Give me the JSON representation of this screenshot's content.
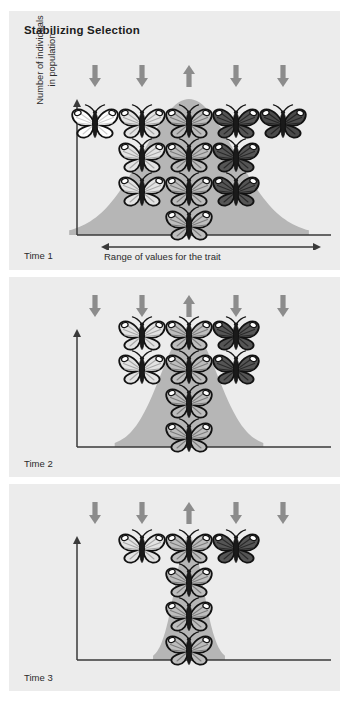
{
  "figure": {
    "title": "Stabilizing Selection",
    "background": "#ececec",
    "page_background": "#ffffff",
    "curve_color": "#b6b6b6",
    "arrow_color": "#8c8c8c",
    "axis_color": "#3a3a3a",
    "text_color": "#2b2b2b"
  },
  "axes": {
    "y_label": "Number of individuals\nin population",
    "x_label": "Range of values for the trait"
  },
  "arrows": {
    "directions": [
      "down",
      "down",
      "up",
      "down",
      "down"
    ],
    "count": 5
  },
  "panels": [
    {
      "id": "panel-1",
      "time_label": "Time 1",
      "show_axis_labels": true,
      "curve_width_factor": 1.0,
      "rows": [
        {
          "y": 0,
          "butterflies": [
            {
              "col": 2,
              "shade": "medium-light"
            }
          ]
        },
        {
          "y": 1,
          "butterflies": [
            {
              "col": 1,
              "shade": "light"
            },
            {
              "col": 2,
              "shade": "medium-light"
            },
            {
              "col": 3,
              "shade": "dark"
            }
          ]
        },
        {
          "y": 2,
          "butterflies": [
            {
              "col": 1,
              "shade": "light"
            },
            {
              "col": 2,
              "shade": "medium-light"
            },
            {
              "col": 3,
              "shade": "dark"
            }
          ]
        },
        {
          "y": 3,
          "butterflies": [
            {
              "col": 0,
              "shade": "white"
            },
            {
              "col": 1,
              "shade": "light"
            },
            {
              "col": 2,
              "shade": "medium-light"
            },
            {
              "col": 3,
              "shade": "dark"
            },
            {
              "col": 4,
              "shade": "darkest"
            }
          ]
        }
      ]
    },
    {
      "id": "panel-2",
      "time_label": "Time 2",
      "show_axis_labels": false,
      "curve_width_factor": 0.62,
      "rows": [
        {
          "y": 0,
          "butterflies": [
            {
              "col": 2,
              "shade": "medium-light"
            }
          ]
        },
        {
          "y": 1,
          "butterflies": [
            {
              "col": 2,
              "shade": "medium-light"
            }
          ]
        },
        {
          "y": 2,
          "butterflies": [
            {
              "col": 1,
              "shade": "light"
            },
            {
              "col": 2,
              "shade": "medium-light"
            },
            {
              "col": 3,
              "shade": "dark"
            }
          ]
        },
        {
          "y": 3,
          "butterflies": [
            {
              "col": 1,
              "shade": "light"
            },
            {
              "col": 2,
              "shade": "medium-light"
            },
            {
              "col": 3,
              "shade": "dark"
            }
          ]
        }
      ]
    },
    {
      "id": "panel-3",
      "time_label": "Time 3",
      "show_axis_labels": false,
      "curve_width_factor": 0.3,
      "rows": [
        {
          "y": 0,
          "butterflies": [
            {
              "col": 2,
              "shade": "medium-light"
            }
          ]
        },
        {
          "y": 1,
          "butterflies": [
            {
              "col": 2,
              "shade": "medium-light"
            }
          ]
        },
        {
          "y": 2,
          "butterflies": [
            {
              "col": 2,
              "shade": "medium-light"
            }
          ]
        },
        {
          "y": 3,
          "butterflies": [
            {
              "col": 1,
              "shade": "light"
            },
            {
              "col": 2,
              "shade": "medium-light"
            },
            {
              "col": 3,
              "shade": "dark"
            }
          ]
        }
      ]
    }
  ],
  "chart_data": {
    "type": "area",
    "title": "Stabilizing Selection",
    "xlabel": "Range of values for the trait",
    "ylabel": "Number of individuals in population",
    "legend": [],
    "grid": false,
    "series": [
      {
        "name": "Time 1",
        "distribution": "normal",
        "relative_width": 1.0,
        "relative_height": 1.0,
        "column_counts": [
          1,
          3,
          4,
          3,
          1
        ]
      },
      {
        "name": "Time 2",
        "distribution": "normal",
        "relative_width": 0.62,
        "relative_height": 1.0,
        "column_counts": [
          0,
          2,
          4,
          2,
          0
        ]
      },
      {
        "name": "Time 3",
        "distribution": "normal",
        "relative_width": 0.3,
        "relative_height": 1.0,
        "column_counts": [
          0,
          1,
          4,
          1,
          0
        ]
      }
    ],
    "categories": [
      "far-low",
      "low",
      "middle",
      "high",
      "far-high"
    ],
    "annotation_arrows": [
      "down",
      "down",
      "up",
      "down",
      "down"
    ],
    "note": "Selection pressure (down arrows) removes extreme trait values; up arrow favors the mean, narrowing the distribution over Time 1 to Time 3."
  }
}
